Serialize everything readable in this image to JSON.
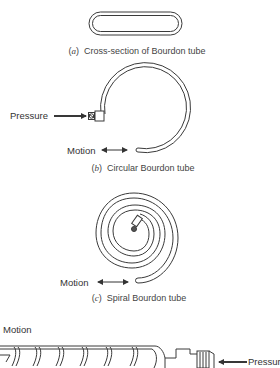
{
  "figure": {
    "panels": [
      {
        "id": "a",
        "letter": "a",
        "caption": "Cross-section of Bourdon tube"
      },
      {
        "id": "b",
        "letter": "b",
        "caption": "Circular Bourdon tube",
        "labels": {
          "pressure": "Pressure",
          "motion": "Motion"
        }
      },
      {
        "id": "c",
        "letter": "c",
        "caption": "Spiral Bourdon tube",
        "labels": {
          "motion": "Motion"
        }
      },
      {
        "id": "d",
        "labels": {
          "motion": "Motion",
          "pressure": "Pressure"
        }
      }
    ],
    "stroke_color": "#3a3a3a",
    "background": "#ffffff"
  }
}
